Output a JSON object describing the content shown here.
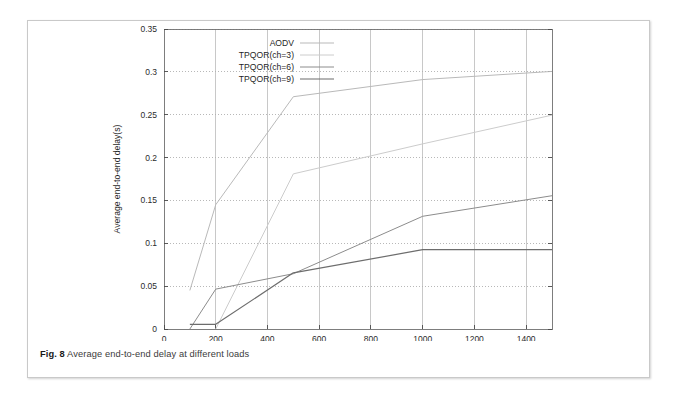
{
  "figure": {
    "caption_label": "Fig. 8",
    "caption_text": "Average end-to-end delay at different loads"
  },
  "chart_data": {
    "type": "line",
    "title": "",
    "xlabel": "CBR sending rate per flow(Kbps)",
    "ylabel": "Average end-to-end delay(s)",
    "xlim": [
      0,
      1500
    ],
    "ylim": [
      0,
      0.35
    ],
    "xticks": [
      0,
      200,
      400,
      600,
      800,
      1000,
      1200,
      1400
    ],
    "xtick_labels": [
      "0",
      "200",
      "400",
      "600",
      "800",
      "1000",
      "1200",
      "1400"
    ],
    "yticks": [
      0,
      0.05,
      0.1,
      0.15,
      0.2,
      0.25,
      0.3,
      0.35
    ],
    "ytick_labels": [
      "0",
      "0.05",
      "0.1",
      "0.15",
      "0.2",
      "0.25",
      "0.3",
      "0.35"
    ],
    "grid": true,
    "grid_style": "dotted",
    "legend_position": "top-left-inside",
    "series": [
      {
        "name": "AODV",
        "color": "#b9b9b9",
        "width": 1.0,
        "x": [
          100,
          200,
          500,
          1000,
          1500
        ],
        "values": [
          0.045,
          0.145,
          0.271,
          0.291,
          0.3005
        ]
      },
      {
        "name": "TPQOR(ch=3)",
        "color": "#cccccc",
        "width": 1.0,
        "x": [
          200,
          500,
          1000,
          1500
        ],
        "values": [
          0.0,
          0.181,
          0.216,
          0.2495
        ]
      },
      {
        "name": "TPQOR(ch=6)",
        "color": "#8c8c8c",
        "width": 1.0,
        "x": [
          100,
          200,
          500,
          1000,
          1500
        ],
        "values": [
          0.0,
          0.0465,
          0.0645,
          0.1315,
          0.1555
        ]
      },
      {
        "name": "TPQOR(ch=9)",
        "color": "#6d6d6d",
        "width": 1.2,
        "x": [
          100,
          200,
          500,
          1000,
          1500
        ],
        "values": [
          0.0055,
          0.0055,
          0.0655,
          0.0925,
          0.0925
        ]
      }
    ]
  }
}
